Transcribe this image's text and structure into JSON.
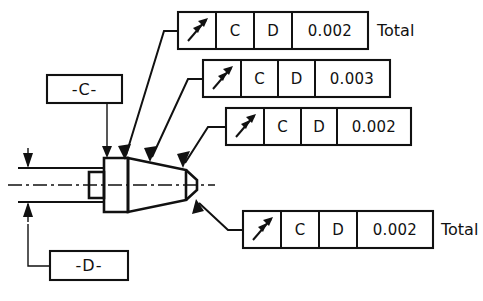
{
  "drawing": {
    "title": "Total Runout GD&T Callout Drawing",
    "symbol_name": "total-runout-symbol",
    "line_color": "#111111",
    "background": "#ffffff"
  },
  "datums": [
    {
      "id": "datum-c",
      "label": "-C-"
    },
    {
      "id": "datum-d",
      "label": "-D-"
    }
  ],
  "feature_control_frames": [
    {
      "id": "fcf-1",
      "symbol": "total-runout-symbol",
      "datum_primary": "C",
      "datum_secondary": "D",
      "tolerance": "0.002",
      "suffix": "Total"
    },
    {
      "id": "fcf-2",
      "symbol": "total-runout-symbol",
      "datum_primary": "C",
      "datum_secondary": "D",
      "tolerance": "0.003",
      "suffix": ""
    },
    {
      "id": "fcf-3",
      "symbol": "total-runout-symbol",
      "datum_primary": "C",
      "datum_secondary": "D",
      "tolerance": "0.002",
      "suffix": ""
    },
    {
      "id": "fcf-4",
      "symbol": "total-runout-symbol",
      "datum_primary": "C",
      "datum_secondary": "D",
      "tolerance": "0.002",
      "suffix": "Total"
    }
  ],
  "part": {
    "name": "stepped-tapered-shaft",
    "features": [
      "left-cylindrical-shaft",
      "small-boss-step",
      "large-flange-shoulder",
      "tapered-cone",
      "right-end-face"
    ]
  }
}
